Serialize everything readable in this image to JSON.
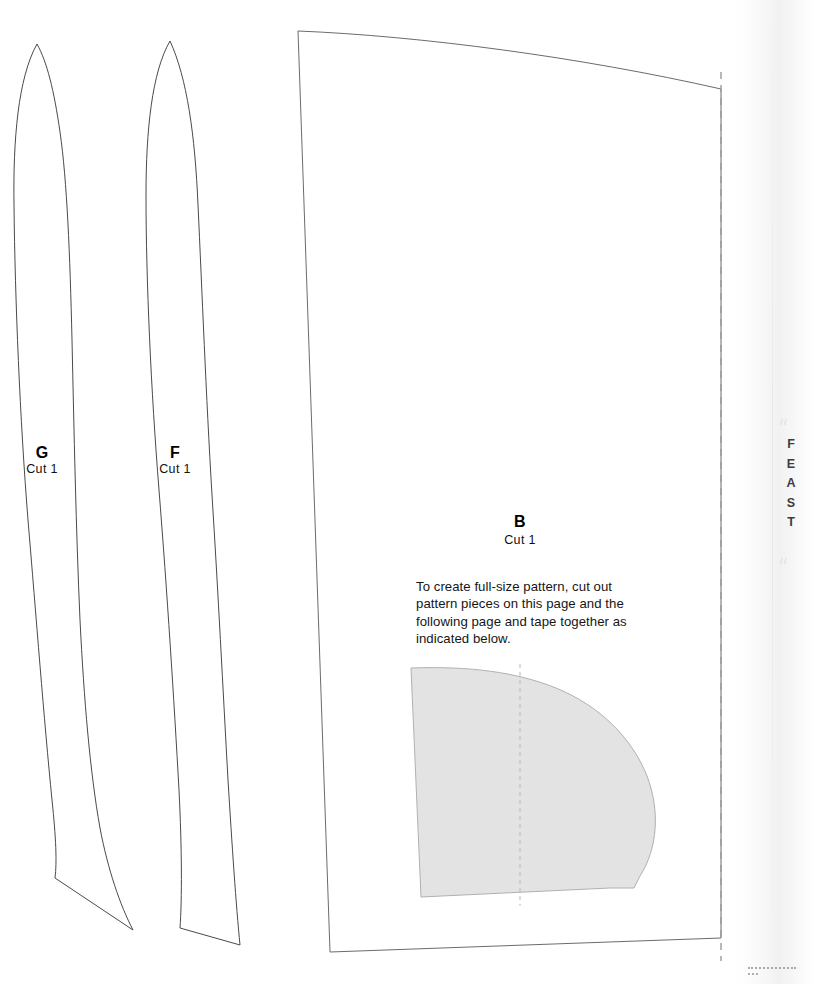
{
  "page": {
    "kind": "sewing-pattern-sheet",
    "background_color": "#ffffff",
    "edge_title": "FEAST"
  },
  "pieces": [
    {
      "id": "G",
      "letter": "G",
      "cut_label": "Cut 1",
      "label_x": 42,
      "label_y": 444,
      "style": "outline",
      "description": "long curved tapered strip, pointed top, pointed bottom tip"
    },
    {
      "id": "F",
      "letter": "F",
      "cut_label": "Cut 1",
      "label_x": 175,
      "label_y": 444,
      "style": "outline",
      "description": "long curved tapered strip, pointed top, flat angled bottom"
    },
    {
      "id": "B",
      "letter": "B",
      "cut_label": "Cut 1",
      "label_x": 520,
      "label_y": 513,
      "style": "panel-with-shaded-subpiece",
      "description": "large panel with curved top edge, right edge is a taping line"
    }
  ],
  "instructions": {
    "text": "To create full-size pattern, cut out pattern pieces on this page and the following page and tape together as indicated below."
  },
  "colors": {
    "outline": "#4a4a4a",
    "panel_outline": "#6b6b6b",
    "shaded_fill": "#e3e3e3",
    "shaded_outline": "#b0b0b0",
    "tape_line": "#9a9a9a",
    "fold_line": "#b9b9b9",
    "text": "#161616"
  },
  "edge_marks": {
    "top": "((",
    "bottom": "((",
    "corner_dots": "................"
  }
}
